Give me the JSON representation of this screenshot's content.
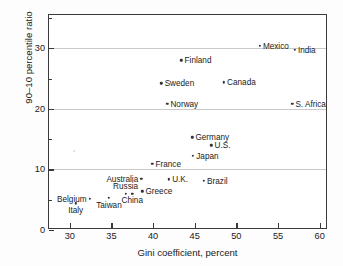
{
  "chart_data": {
    "type": "scatter",
    "title": "",
    "xlabel": "Gini coefficient, percent",
    "ylabel": "90–10 percentile ratio",
    "xlim": [
      27.5,
      61.0
    ],
    "ylim": [
      0,
      35.5
    ],
    "xticks": [
      30,
      35,
      40,
      45,
      50,
      55,
      60
    ],
    "xtick_labels": [
      "30",
      "35",
      "40",
      "45",
      "50",
      "55",
      "60"
    ],
    "yticks": [
      0,
      10,
      20,
      30
    ],
    "ytick_labels": [
      "0",
      "10",
      "20",
      "30"
    ],
    "yticks_minor": [
      5,
      15,
      25,
      35
    ],
    "grid": "horizontal gridlines at y = 10, 20, 30",
    "legend": "none",
    "points": [
      {
        "label": "Mexico",
        "x": 52.8,
        "y": 30.4,
        "label_pos": "right"
      },
      {
        "label": "India",
        "x": 57.0,
        "y": 29.8,
        "label_pos": "right"
      },
      {
        "label": "Finland",
        "x": 43.4,
        "y": 28.0,
        "label_pos": "right"
      },
      {
        "label": "Sweden",
        "x": 41.0,
        "y": 24.2,
        "label_pos": "right"
      },
      {
        "label": "Canada",
        "x": 48.5,
        "y": 24.4,
        "label_pos": "right"
      },
      {
        "label": "Norway",
        "x": 41.7,
        "y": 20.8,
        "label_pos": "right"
      },
      {
        "label": "S. Africa",
        "x": 56.7,
        "y": 20.8,
        "label_pos": "right"
      },
      {
        "label": "Germany",
        "x": 44.7,
        "y": 15.3,
        "label_pos": "right"
      },
      {
        "label": "U.S.",
        "x": 47.0,
        "y": 14.0,
        "label_pos": "right"
      },
      {
        "label": "Japan",
        "x": 44.8,
        "y": 12.3,
        "label_pos": "right"
      },
      {
        "label": "France",
        "x": 39.9,
        "y": 10.9,
        "label_pos": "right"
      },
      {
        "label": "Australia",
        "x": 38.6,
        "y": 8.5,
        "label_pos": "left"
      },
      {
        "label": "U.K.",
        "x": 41.9,
        "y": 8.4,
        "label_pos": "right"
      },
      {
        "label": "Brazil",
        "x": 46.1,
        "y": 8.1,
        "label_pos": "right"
      },
      {
        "label": "Greece",
        "x": 38.7,
        "y": 6.4,
        "label_pos": "right"
      },
      {
        "label": "Russia",
        "x": 36.7,
        "y": 6.0,
        "label_pos": "above"
      },
      {
        "label": "China",
        "x": 37.5,
        "y": 6.0,
        "label_pos": "below"
      },
      {
        "label": "Taiwan",
        "x": 34.7,
        "y": 5.3,
        "label_pos": "below"
      },
      {
        "label": "Belgium",
        "x": 32.4,
        "y": 5.2,
        "label_pos": "left"
      },
      {
        "label": "Italy",
        "x": 30.7,
        "y": 4.4,
        "label_pos": "below"
      }
    ]
  }
}
